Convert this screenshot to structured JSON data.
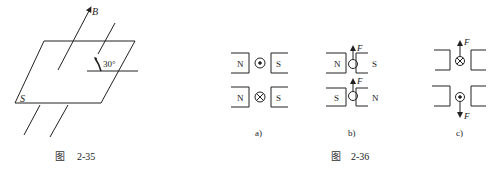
{
  "figure_2_35": {
    "caption_prefix": "图",
    "caption_number": "2-35",
    "labels": {
      "field": "B",
      "surface": "S",
      "angle": "30°"
    }
  },
  "figure_2_36": {
    "caption_prefix": "图",
    "caption_number": "2-36",
    "panels": [
      {
        "label": "a)",
        "rows": [
          {
            "left_pole": "N",
            "right_pole": "S",
            "current": "out-of-page",
            "force": ""
          },
          {
            "left_pole": "N",
            "right_pole": "S",
            "current": "into-page",
            "force": ""
          }
        ]
      },
      {
        "label": "b)",
        "rows": [
          {
            "left_pole": "N",
            "right_pole": "S",
            "current": "unknown",
            "force": "F"
          },
          {
            "left_pole": "S",
            "right_pole": "N",
            "current": "unknown",
            "force": "F"
          }
        ]
      },
      {
        "label": "c)",
        "rows": [
          {
            "left_pole": "",
            "right_pole": "",
            "current": "into-page",
            "force": "F"
          },
          {
            "left_pole": "",
            "right_pole": "",
            "current": "out-of-page",
            "force": "F"
          }
        ]
      }
    ]
  }
}
